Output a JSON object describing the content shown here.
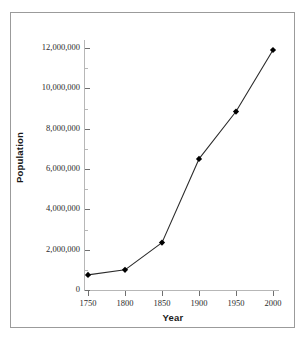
{
  "chart_data": {
    "type": "line",
    "title": "",
    "xlabel": "Year",
    "ylabel": "Population",
    "x": [
      1750,
      1800,
      1850,
      1900,
      1950,
      2000
    ],
    "values": [
      750000,
      1000000,
      2350000,
      6500000,
      8850000,
      11900000
    ],
    "series": [
      {
        "name": "Population",
        "values": [
          750000,
          1000000,
          2350000,
          6500000,
          8850000,
          11900000
        ]
      }
    ],
    "xlim": [
      1750,
      2000
    ],
    "ylim": [
      0,
      12400000
    ],
    "xticks": [
      1750,
      1800,
      1850,
      1900,
      1950,
      2000
    ],
    "xtick_labels": [
      "1750",
      "1800",
      "1850",
      "1900",
      "1950",
      "2000"
    ],
    "yticks": [
      0,
      2000000,
      4000000,
      6000000,
      8000000,
      10000000,
      12000000
    ],
    "ytick_labels": [
      "0",
      "2,000,000",
      "4,000,000",
      "6,000,000",
      "8,000,000",
      "10,000,000",
      "12,000,000"
    ],
    "y_minor_ticks": [
      1000000,
      3000000,
      5000000,
      7000000,
      9000000,
      11000000
    ],
    "grid": false,
    "legend": false,
    "marker": "filled-diamond",
    "line_color": "#2b2b2b",
    "marker_color": "#000000",
    "axis_color": "#b7b7b7",
    "background_color": "#ffffff",
    "border_color": "#9b9b9b"
  }
}
